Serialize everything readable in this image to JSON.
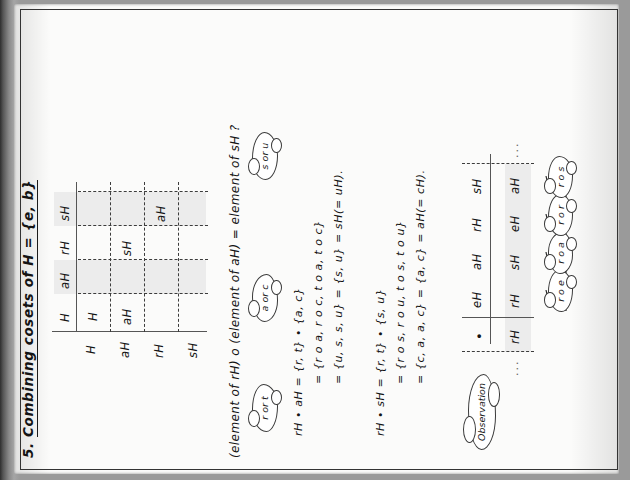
{
  "page": {
    "title_prefix": "5.",
    "title": "Combining cosets of H = {e, b}"
  },
  "top_table": {
    "corner": "",
    "col_headers": [
      "H",
      "aH",
      "rH",
      "sH"
    ],
    "row_headers": [
      "H",
      "aH",
      "rH",
      "sH"
    ],
    "filled_cells": [
      {
        "row": 0,
        "col": 0,
        "value": "H"
      },
      {
        "row": 1,
        "col": 0,
        "value": "aH"
      },
      {
        "row": 1,
        "col": 2,
        "value": "sH"
      },
      {
        "row": 2,
        "col": 2,
        "value": "aH"
      }
    ]
  },
  "question": "(element of rH) o (element of aH) = element of sH ?",
  "clouds": {
    "r_or_t": "r or t",
    "a_or_c": "a or c",
    "s_or_u": "s or u",
    "observation": "Observation"
  },
  "derivation_1": {
    "line1": "rH • aH = {r, t} • {a, c}",
    "line2": "= {r o a, r o c, t o a, t o c}",
    "line3": "= {u, s, s, u} = {s, u} = sH(= uH)."
  },
  "derivation_2": {
    "line1": "rH • sH = {r, t} • {s, u}",
    "line2": "= {r o s, r o u, t o s, t o u}",
    "line3": "= {c, a, a, c} = {a, c} = aH(= cH)."
  },
  "bottom_table": {
    "corner": "•",
    "col_headers": [
      "eH",
      "aH",
      "rH",
      "sH"
    ],
    "row_header": "rH",
    "row_values": [
      "rH",
      "sH",
      "eH",
      "aH"
    ],
    "ellipsis_left": "...",
    "ellipsis_right": "...",
    "annotations": [
      "r o e",
      "r o a",
      "r o r",
      "r o s"
    ]
  }
}
